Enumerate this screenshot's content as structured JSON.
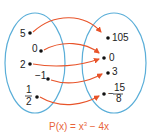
{
  "diagram": {
    "type": "function-mapping",
    "colors": {
      "set_outline": "#5aaed8",
      "arrow": "#e8542a",
      "caption": "#e8643a",
      "dot": "#111111"
    },
    "domain": [
      {
        "label": "5",
        "num": null,
        "den": null
      },
      {
        "label": "0",
        "num": null,
        "den": null
      },
      {
        "label": "2",
        "num": null,
        "den": null
      },
      {
        "label": "−1",
        "num": null,
        "den": null
      },
      {
        "label": null,
        "num": "1",
        "den": "2"
      }
    ],
    "codomain": [
      {
        "label": "105",
        "sign": null,
        "num": null,
        "den": null
      },
      {
        "label": "0",
        "sign": null,
        "num": null,
        "den": null
      },
      {
        "label": "3",
        "sign": null,
        "num": null,
        "den": null
      },
      {
        "label": null,
        "sign": "−",
        "num": "15",
        "den": "8"
      }
    ],
    "mappings": [
      {
        "from": "5",
        "to": "105"
      },
      {
        "from": "0",
        "to": "0"
      },
      {
        "from": "2",
        "to": "0"
      },
      {
        "from": "−1",
        "to": "3"
      },
      {
        "from": "1/2",
        "to": "−15/8"
      }
    ],
    "caption": {
      "lhs": "P(x) = x",
      "exp": "3",
      "rhs": " − 4x"
    }
  }
}
